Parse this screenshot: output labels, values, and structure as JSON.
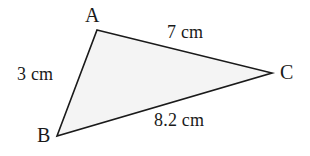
{
  "figure": {
    "type": "triangle-diagram",
    "background_color": "#ffffff",
    "fill_color": "#f4f4f4",
    "stroke_color": "#1a1a1a",
    "stroke_width": 1.6,
    "canvas": {
      "width": 310,
      "height": 156
    }
  },
  "vertices": [
    {
      "key": "A",
      "label": "A",
      "x": 97,
      "y": 30
    },
    {
      "key": "B",
      "label": "B",
      "x": 57,
      "y": 136
    },
    {
      "key": "C",
      "label": "C",
      "x": 272,
      "y": 73
    }
  ],
  "sides": [
    {
      "key": "AB",
      "label": "3 cm",
      "value": 3,
      "unit": "cm",
      "from": "A",
      "to": "B"
    },
    {
      "key": "AC",
      "label": "7 cm",
      "value": 7,
      "unit": "cm",
      "from": "A",
      "to": "C"
    },
    {
      "key": "BC",
      "label": "8.2 cm",
      "value": 8.2,
      "unit": "cm",
      "from": "B",
      "to": "C"
    }
  ],
  "polygon_points": "97,30 272,73 57,136"
}
